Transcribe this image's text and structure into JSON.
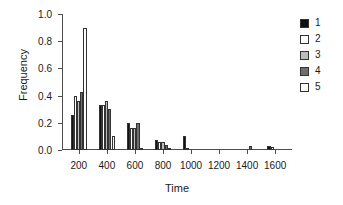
{
  "chart_data": {
    "type": "bar",
    "title": "",
    "xlabel": "Time",
    "ylabel": "Frequency",
    "xlim": [
      80,
      1720
    ],
    "ylim": [
      0.0,
      1.0
    ],
    "grid": false,
    "legend_position": "right",
    "xticks": [
      200,
      400,
      600,
      800,
      1000,
      1200,
      1400,
      1600
    ],
    "xtick_labels": [
      "200",
      "400",
      "600",
      "800",
      "1000",
      "1200",
      "1400",
      "1600"
    ],
    "yticks": [
      0.0,
      0.2,
      0.4,
      0.6,
      0.8,
      1.0
    ],
    "ytick_labels": [
      "0.0",
      "0.2",
      "0.4",
      "0.6",
      "0.8",
      "1.0"
    ],
    "group_centers": [
      200,
      400,
      600,
      800,
      1000,
      1200,
      1400,
      1600
    ],
    "bar_width": 22,
    "series": [
      {
        "name": "1",
        "color": "#111111",
        "values": [
          0.26,
          0.33,
          0.195,
          0.07,
          0.1,
          0.0,
          0.0,
          0.03
        ]
      },
      {
        "name": "2",
        "color": "#ffffff",
        "values": [
          0.4,
          0.33,
          0.165,
          0.06,
          0.012,
          0.0,
          0.0,
          0.025
        ]
      },
      {
        "name": "3",
        "color": "#bdbdbd",
        "values": [
          0.36,
          0.36,
          0.165,
          0.06,
          0.0,
          0.0,
          0.0,
          0.0
        ]
      },
      {
        "name": "4",
        "color": "#6e6e6e",
        "values": [
          0.43,
          0.3,
          0.195,
          0.04,
          0.0,
          0.0,
          0.03,
          0.0
        ]
      },
      {
        "name": "5",
        "color": "#fbfbfb",
        "values": [
          0.9,
          0.1,
          0.006,
          0.006,
          0.0,
          0.0,
          0.0,
          0.0
        ]
      }
    ]
  },
  "legend": {
    "entries": [
      {
        "label": "1",
        "color": "#111111"
      },
      {
        "label": "2",
        "color": "#ffffff"
      },
      {
        "label": "3",
        "color": "#bdbdbd"
      },
      {
        "label": "4",
        "color": "#6e6e6e"
      },
      {
        "label": "5",
        "color": "#fbfbfb"
      }
    ]
  }
}
